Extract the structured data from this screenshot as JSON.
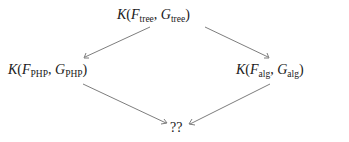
{
  "diagram": {
    "type": "commutative-diagram",
    "nodes": [
      {
        "id": "top",
        "func": "K",
        "f": "F",
        "f_sub": "tree",
        "g": "G",
        "g_sub": "tree",
        "label": "K(F_tree, G_tree)"
      },
      {
        "id": "left",
        "func": "K",
        "f": "F",
        "f_sub": "PHP",
        "g": "G",
        "g_sub": "PHP",
        "label": "K(F_PHP, G_PHP)"
      },
      {
        "id": "right",
        "func": "K",
        "f": "F",
        "f_sub": "alg",
        "g": "G",
        "g_sub": "alg",
        "label": "K(F_alg, G_alg)"
      },
      {
        "id": "bottom",
        "label": "??"
      }
    ],
    "edges": [
      {
        "from": "top",
        "to": "left"
      },
      {
        "from": "top",
        "to": "right"
      },
      {
        "from": "left",
        "to": "bottom"
      },
      {
        "from": "right",
        "to": "bottom"
      }
    ],
    "edge_color": "#6e6e6e"
  }
}
